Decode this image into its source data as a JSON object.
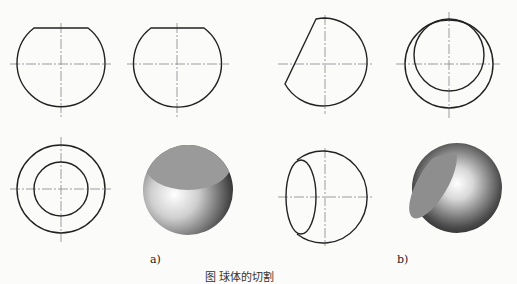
{
  "figure": {
    "panels": [
      {
        "id": "a",
        "label": "a)",
        "description": "Sphere cut by a horizontal plane: front view, side view, top view (concentric circles), 3D shaded model"
      },
      {
        "id": "b",
        "label": "b)",
        "description": "Sphere cut by an inclined plane: front view, side view, top view with ellipse, 3D shaded model"
      }
    ],
    "caption": "图  球体的切割"
  }
}
